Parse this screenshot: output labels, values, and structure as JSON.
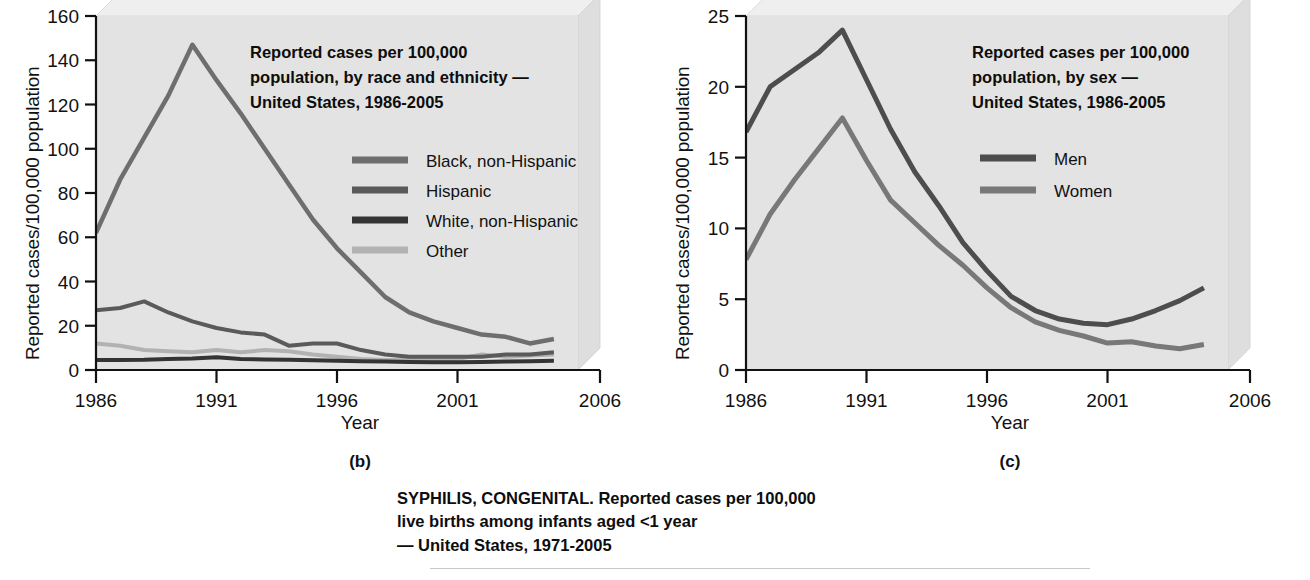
{
  "figure": {
    "footnote_lines": [
      "SYPHILIS, CONGENITAL. Reported cases per 100,000",
      "live births among infants aged <1 year",
      "— United States, 1971-2005"
    ]
  },
  "panels": [
    {
      "letter": "(b)",
      "xlabel": "Year",
      "ylabel": "Reported cases/100,000 population",
      "title_lines": [
        "Reported cases per 100,000",
        "population,  by race and ethnicity —",
        "United States, 1986-2005"
      ]
    },
    {
      "letter": "(c)",
      "xlabel": "Year",
      "ylabel": "Reported cases/100,000 population",
      "title_lines": [
        "Reported cases per 100,000",
        "population, by sex —",
        "United States, 1986-2005"
      ]
    }
  ],
  "chart_data": [
    {
      "type": "line",
      "title": "Reported cases per 100,000 population,  by race and ethnicity — United States, 1986-2005",
      "xlabel": "Year",
      "ylabel": "Reported cases/100,000 population",
      "xlim": [
        1986,
        2006
      ],
      "ylim": [
        0,
        160
      ],
      "xticks": [
        1986,
        1991,
        1996,
        2001,
        2006
      ],
      "yticks": [
        0,
        20,
        40,
        60,
        80,
        100,
        120,
        140,
        160
      ],
      "grid": false,
      "legend_position": "inside-right",
      "x": [
        1986,
        1987,
        1988,
        1989,
        1990,
        1991,
        1992,
        1993,
        1994,
        1995,
        1996,
        1997,
        1998,
        1999,
        2000,
        2001,
        2002,
        2003,
        2004,
        2005
      ],
      "series": [
        {
          "name": "Black, non-Hispanic",
          "color": "#6e6e6e",
          "width": 4.5,
          "values": [
            62,
            86,
            105,
            124,
            147,
            131,
            116,
            100,
            84,
            68,
            55,
            44,
            33,
            26,
            22,
            19,
            16,
            15,
            12,
            14
          ]
        },
        {
          "name": "Hispanic",
          "color": "#5a5a5a",
          "width": 4.0,
          "values": [
            27,
            28,
            31,
            26,
            22,
            19,
            17,
            16,
            11,
            12,
            12,
            9,
            7,
            6,
            6,
            6,
            6,
            7,
            7,
            8
          ]
        },
        {
          "name": "White, non-Hispanic",
          "color": "#343434",
          "width": 4.0,
          "values": [
            4.5,
            4.5,
            4.6,
            5,
            5.2,
            5.8,
            5,
            4.8,
            4.6,
            4.4,
            4.2,
            4,
            3.8,
            3.6,
            3.5,
            3.5,
            3.6,
            3.8,
            4,
            4.2
          ]
        },
        {
          "name": "Other",
          "color": "#b2b2b2",
          "width": 4.0,
          "values": [
            12,
            11,
            9,
            8.5,
            8,
            9,
            8,
            9,
            8.5,
            7,
            6,
            5,
            4.5,
            4.5,
            4.5,
            5,
            7,
            6,
            6.5,
            7
          ]
        }
      ]
    },
    {
      "type": "line",
      "title": "Reported cases per 100,000 population, by sex — United States, 1986-2005",
      "xlabel": "Year",
      "ylabel": "Reported cases/100,000 population",
      "xlim": [
        1986,
        2006
      ],
      "ylim": [
        0,
        25
      ],
      "xticks": [
        1986,
        1991,
        1996,
        2001,
        2006
      ],
      "yticks": [
        0,
        5,
        10,
        15,
        20,
        25
      ],
      "grid": false,
      "legend_position": "inside-right",
      "x": [
        1986,
        1987,
        1988,
        1989,
        1990,
        1991,
        1992,
        1993,
        1994,
        1995,
        1996,
        1997,
        1998,
        1999,
        2000,
        2001,
        2002,
        2003,
        2004,
        2005
      ],
      "series": [
        {
          "name": "Men",
          "color": "#4d4d4d",
          "width": 5.0,
          "values": [
            16.8,
            20.0,
            21.2,
            22.4,
            24.0,
            20.5,
            17.0,
            14.0,
            11.6,
            9.0,
            7.0,
            5.2,
            4.2,
            3.6,
            3.3,
            3.2,
            3.6,
            4.2,
            4.9,
            5.8
          ]
        },
        {
          "name": "Women",
          "color": "#787878",
          "width": 5.0,
          "values": [
            7.8,
            11.0,
            13.4,
            15.6,
            17.8,
            14.8,
            12.0,
            10.4,
            8.8,
            7.4,
            5.8,
            4.4,
            3.4,
            2.8,
            2.4,
            1.9,
            2.0,
            1.7,
            1.5,
            1.8
          ]
        }
      ]
    }
  ]
}
